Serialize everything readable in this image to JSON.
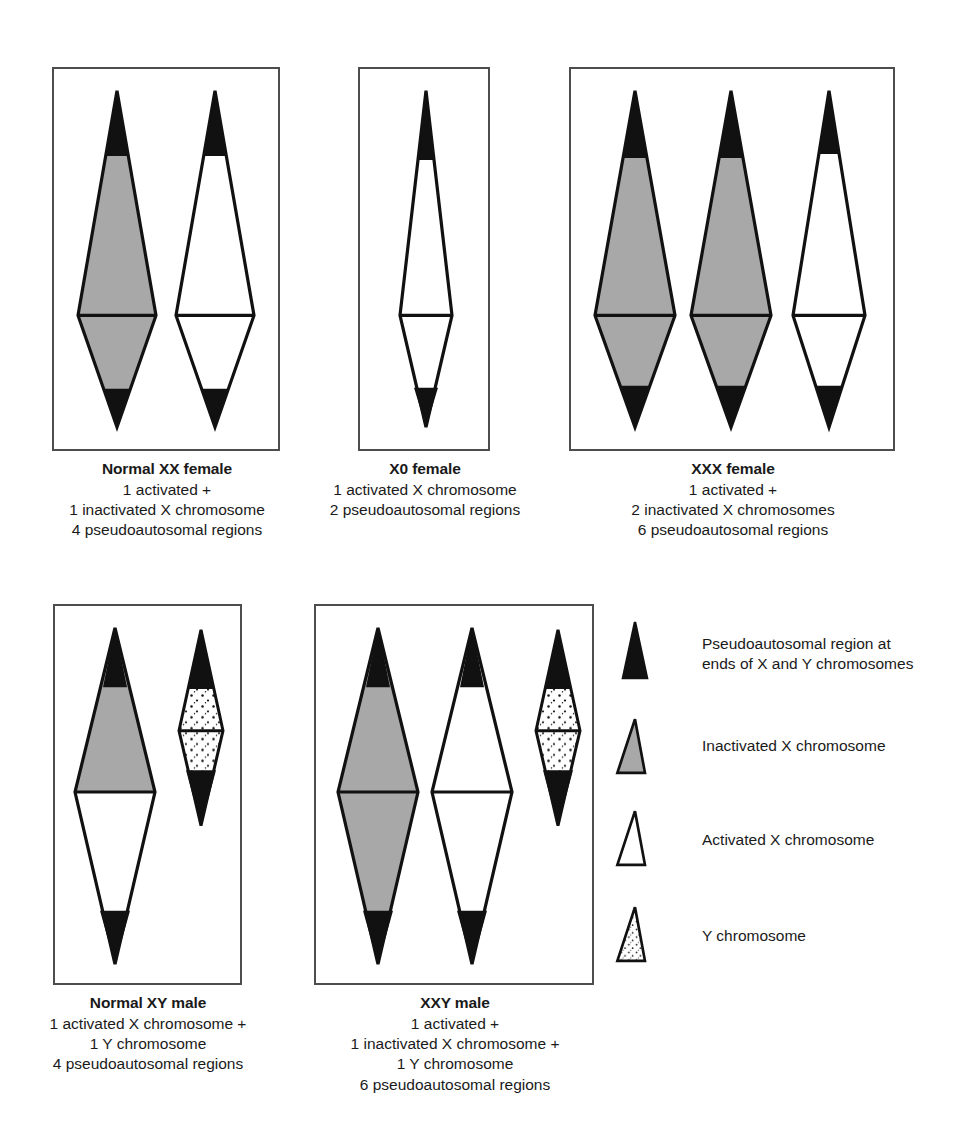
{
  "figure": {
    "colors": {
      "pseudoautosomal_black": "#111111",
      "inactivated_gray": "#a8a8a8",
      "activated_white": "#ffffff",
      "outline": "#111111",
      "panel_border": "#4d4d4d",
      "background": "#ffffff",
      "text": "#1a1a1a"
    }
  },
  "panels": [
    {
      "id": "normal-xx-female",
      "title": "Normal XX female",
      "lines": [
        "1 activated +",
        "1 inactivated X chromosome",
        "4 pseudoautosomal regions"
      ],
      "chromosomes": [
        {
          "name": "inactivated-x",
          "type": "X",
          "fill": "inactivated_gray",
          "tips": "black"
        },
        {
          "name": "activated-x",
          "type": "X",
          "fill": "activated_white",
          "tips": "black"
        }
      ]
    },
    {
      "id": "x0-female",
      "title": "X0 female",
      "lines": [
        "1 activated X chromosome",
        "2 pseudoautosomal regions"
      ],
      "chromosomes": [
        {
          "name": "activated-x",
          "type": "X",
          "fill": "activated_white",
          "tips": "black"
        }
      ]
    },
    {
      "id": "xxx-female",
      "title": "XXX female",
      "lines": [
        "1 activated +",
        "2 inactivated X chromosomes",
        "6 pseudoautosomal regions"
      ],
      "chromosomes": [
        {
          "name": "inactivated-x-1",
          "type": "X",
          "fill": "inactivated_gray",
          "tips": "black"
        },
        {
          "name": "inactivated-x-2",
          "type": "X",
          "fill": "inactivated_gray",
          "tips": "black"
        },
        {
          "name": "activated-x",
          "type": "X",
          "fill": "activated_white",
          "tips": "black"
        }
      ]
    },
    {
      "id": "normal-xy-male",
      "title": "Normal XY male",
      "lines": [
        "1 activated X chromosome +",
        "1 Y chromosome",
        "4 pseudoautosomal regions"
      ],
      "chromosomes": [
        {
          "name": "activated-x",
          "type": "X",
          "fill": "activated_white",
          "tips": "black"
        },
        {
          "name": "y-chromosome",
          "type": "Y",
          "fill": "stippled",
          "tips": "black"
        }
      ]
    },
    {
      "id": "xxy-male",
      "title": "XXY male",
      "lines": [
        "1 activated +",
        "1 inactivated X chromosome +",
        "1 Y chromosome",
        "6 pseudoautosomal regions"
      ],
      "chromosomes": [
        {
          "name": "inactivated-x",
          "type": "X",
          "fill": "inactivated_gray",
          "tips": "black"
        },
        {
          "name": "activated-x",
          "type": "X",
          "fill": "activated_white",
          "tips": "black"
        },
        {
          "name": "y-chromosome",
          "type": "Y",
          "fill": "stippled",
          "tips": "black"
        }
      ]
    }
  ],
  "legend": {
    "items": [
      {
        "key": "pseudoautosomal-region",
        "swatch": "black-trapezoid",
        "lines": [
          "Pseudoautosomal region at",
          "ends of X and Y chromosomes"
        ]
      },
      {
        "key": "inactivated-x-chromosome",
        "swatch": "gray-trapezoid",
        "lines": [
          "Inactivated X chromosome"
        ]
      },
      {
        "key": "activated-x-chromosome",
        "swatch": "white-trapezoid",
        "lines": [
          "Activated X chromosome"
        ]
      },
      {
        "key": "y-chromosome",
        "swatch": "stippled-trapezoid",
        "lines": [
          "Y chromosome"
        ]
      }
    ]
  }
}
